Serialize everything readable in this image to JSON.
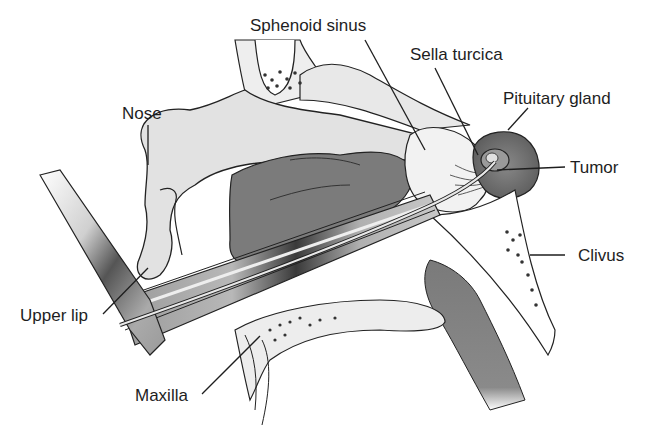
{
  "figure": {
    "labels": [
      {
        "id": "sphenoid-sinus",
        "text": "Sphenoid sinus"
      },
      {
        "id": "sella-turcica",
        "text": "Sella turcica"
      },
      {
        "id": "pituitary-gland",
        "text": "Pituitary gland"
      },
      {
        "id": "nose",
        "text": "Nose"
      },
      {
        "id": "tumor",
        "text": "Tumor"
      },
      {
        "id": "clivus",
        "text": "Clivus"
      },
      {
        "id": "upper-lip",
        "text": "Upper lip"
      },
      {
        "id": "maxilla",
        "text": "Maxilla"
      }
    ]
  },
  "colors": {
    "ink": "#1e1e1e",
    "tissue_light": "#e6e6e6",
    "tissue_mid": "#bdbdbd",
    "tissue_dark": "#7a7a7a",
    "gland": "#6e6e6e",
    "bone": "#f7f7f7"
  }
}
